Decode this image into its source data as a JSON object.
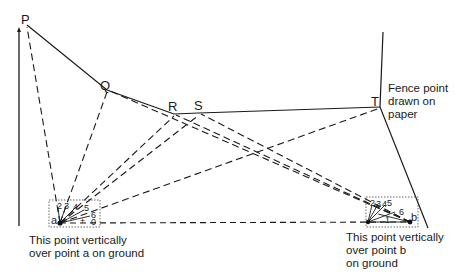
{
  "diagram": {
    "points": {
      "P": {
        "label": "P",
        "x": 27,
        "y": 25
      },
      "Q": {
        "label": "Q",
        "x": 107,
        "y": 90
      },
      "R": {
        "label": "R",
        "x": 174,
        "y": 114
      },
      "S": {
        "label": "S",
        "x": 199,
        "y": 113
      },
      "T": {
        "label": "T",
        "x": 380,
        "y": 107
      }
    },
    "stations": {
      "a": {
        "label": "a",
        "x": 60,
        "y": 223
      },
      "b": {
        "label": "b",
        "x": 410,
        "y": 222
      }
    },
    "ray_labels_a": [
      "2",
      "3",
      "4",
      "5",
      "6",
      "+",
      "0"
    ],
    "ray_labels_b": [
      "2",
      "3",
      "4",
      "5",
      "6",
      "1"
    ],
    "annotations": {
      "fence_note": "Fence point drawn on paper",
      "fence_note_lines": [
        "Fence point",
        "drawn on",
        "paper"
      ],
      "caption_a": "This point vertically over point a on ground",
      "caption_a_lines": [
        "This point vertically",
        "over point a on ground"
      ],
      "caption_b": "This point vertically over point b on ground",
      "caption_b_lines": [
        "This point vertically",
        "over point b",
        "on ground"
      ]
    },
    "colors": {
      "line": "#1a1a1a",
      "dotted_box": "#555555",
      "background": "#ffffff"
    }
  }
}
